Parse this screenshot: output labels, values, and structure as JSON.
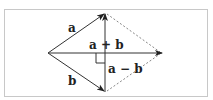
{
  "diagram": {
    "title": "",
    "colors": {
      "frame": "#c8c8c8",
      "line": "#333333",
      "dashed": "#888888",
      "background": "#ffffff"
    },
    "points": {
      "origin": [
        48,
        53
      ],
      "top": [
        105,
        13
      ],
      "bottom": [
        105,
        92
      ],
      "right": [
        162,
        53
      ]
    },
    "vectors": [
      {
        "name": "a",
        "from": "origin",
        "to": "top",
        "style": "solid-arrow"
      },
      {
        "name": "b",
        "from": "origin",
        "to": "bottom",
        "style": "solid-arrow"
      },
      {
        "name": "a + b",
        "from": "origin",
        "to": "right",
        "style": "solid-arrow"
      },
      {
        "name": "a − b",
        "from": "bottom",
        "to": "top",
        "style": "solid-arrow"
      }
    ],
    "dashed_edges": [
      {
        "from": "top",
        "to": "right"
      },
      {
        "from": "bottom",
        "to": "right"
      }
    ],
    "labels": {
      "a": "a",
      "b": "b",
      "sum": "a + b",
      "diff": "a − b"
    },
    "right_angle_marker": true
  }
}
